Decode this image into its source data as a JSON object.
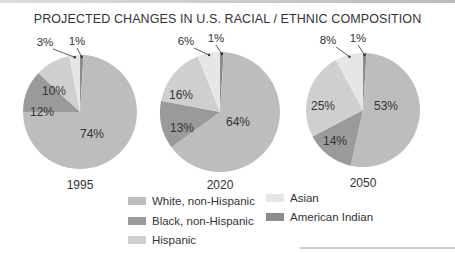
{
  "chart_data": {
    "type": "pie",
    "title": "PROJECTED CHANGES IN U.S. RACIAL / ETHNIC COMPOSITION",
    "categories": [
      "White, non-Hispanic",
      "Black, non-Hispanic",
      "Hispanic",
      "Asian",
      "American Indian"
    ],
    "colors": [
      "#bdbdbd",
      "#9a9a9a",
      "#cfcfcf",
      "#e6e6e6",
      "#8c8c8c"
    ],
    "series": [
      {
        "name": "1995",
        "values": [
          74,
          12,
          10,
          3,
          1
        ],
        "labels": [
          "74%",
          "12%",
          "10%",
          "3%",
          "1%"
        ]
      },
      {
        "name": "2020",
        "values": [
          64,
          13,
          16,
          6,
          1
        ],
        "labels": [
          "64%",
          "13%",
          "16%",
          "6%",
          "1%"
        ]
      },
      {
        "name": "2050",
        "values": [
          53,
          14,
          25,
          8,
          1
        ],
        "labels": [
          "53%",
          "14%",
          "25%",
          "8%",
          "1%"
        ]
      }
    ],
    "legend": {
      "placement": "bottom",
      "items": [
        "White, non-Hispanic",
        "Black, non-Hispanic",
        "Hispanic",
        "Asian",
        "American Indian"
      ]
    }
  }
}
